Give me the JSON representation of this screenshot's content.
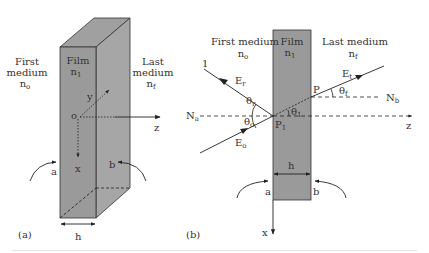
{
  "colors": {
    "film": "#9a9a9a",
    "film_side": "#a6a6a6",
    "film_top": "#a0a0a0",
    "line": "#333333"
  },
  "panel_a": {
    "caption": "(a)",
    "first_medium": {
      "line1": "First",
      "line2": "medium",
      "index": "n",
      "index_sub": "o"
    },
    "film": {
      "label": "Film",
      "index": "n",
      "index_sub": "1"
    },
    "last_medium": {
      "line1": "Last",
      "line2": "medium",
      "index": "n",
      "index_sub": "f"
    },
    "origin_label": "o",
    "axes": {
      "x": "x",
      "y": "y",
      "z": "z"
    },
    "interface_a": "a",
    "interface_b": "b",
    "thickness": "h"
  },
  "panel_b": {
    "caption": "(b)",
    "first_medium": {
      "label": "First medium",
      "index": "n",
      "index_sub": "o"
    },
    "film": {
      "label": "Film",
      "index": "n",
      "index_sub": "1"
    },
    "last_medium": {
      "label": "Last medium",
      "index": "n",
      "index_sub": "f"
    },
    "reflected_ray_label": "1",
    "E_r": {
      "base": "E",
      "sub": "r"
    },
    "E_o": {
      "base": "E",
      "sub": "o"
    },
    "E_t": {
      "base": "E",
      "sub": "t"
    },
    "theta_r": {
      "base": "θ",
      "sub": "r"
    },
    "theta_o": {
      "base": "θ",
      "sub": "o"
    },
    "theta_1": {
      "base": "θ",
      "sub": "1"
    },
    "theta_f": {
      "base": "θ",
      "sub": "f"
    },
    "normal_a": {
      "base": "N",
      "sub": "a"
    },
    "normal_b": {
      "base": "N",
      "sub": "b"
    },
    "point_P1": {
      "base": "P",
      "sub": "1"
    },
    "point_P": "P",
    "axes": {
      "x": "x",
      "z": "z"
    },
    "interface_a": "a",
    "interface_b": "b",
    "thickness": "h"
  }
}
